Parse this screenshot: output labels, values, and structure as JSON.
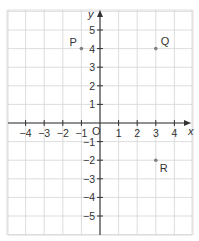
{
  "diagram": {
    "type": "coordinate-grid",
    "colors": {
      "grid": "#d4d4d4",
      "axis": "#333333",
      "point": "#808080",
      "text": "#333333",
      "background": "#ffffff"
    },
    "axes": {
      "x_label": "x",
      "y_label": "y",
      "origin_label": "O",
      "x_ticks": [
        "−4",
        "−3",
        "−2",
        "−1",
        "1",
        "2",
        "3",
        "4"
      ],
      "x_tick_values": [
        -4,
        -3,
        -2,
        -1,
        1,
        2,
        3,
        4
      ],
      "y_ticks": [
        "5",
        "4",
        "3",
        "2",
        "1",
        "−1",
        "−2",
        "−3",
        "−4",
        "−5"
      ],
      "y_tick_values": [
        5,
        4,
        3,
        2,
        1,
        -1,
        -2,
        -3,
        -4,
        -5
      ],
      "x_range": [
        -5,
        5
      ],
      "y_range": [
        -6,
        6
      ]
    },
    "points": [
      {
        "label": "P",
        "x": -1,
        "y": 4
      },
      {
        "label": "Q",
        "x": 3,
        "y": 4
      },
      {
        "label": "R",
        "x": 3,
        "y": -2
      }
    ]
  }
}
